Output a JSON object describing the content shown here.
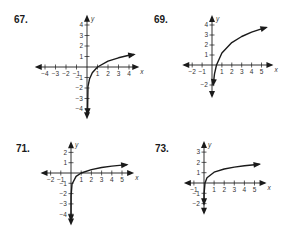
{
  "chart_data": [
    {
      "type": "line",
      "problem": "67.",
      "title": "",
      "xlabel": "x",
      "ylabel": "y",
      "x_ticks": [
        -4,
        -3,
        -2,
        -1,
        1,
        2,
        3,
        4
      ],
      "y_ticks": [
        -4,
        -3,
        -2,
        -1,
        1,
        2,
        3,
        4
      ],
      "xlim": [
        -4.5,
        4.5
      ],
      "ylim": [
        -4.5,
        4.5
      ],
      "grid": false,
      "series": [
        {
          "name": "curve",
          "points": [
            [
              0.05,
              -4.5
            ],
            [
              0.1,
              -1.84
            ],
            [
              0.25,
              -1.11
            ],
            [
              0.5,
              -0.55
            ],
            [
              1,
              0
            ],
            [
              2,
              0.55
            ],
            [
              3,
              0.88
            ],
            [
              4,
              1.11
            ],
            [
              4.5,
              1.2
            ]
          ]
        }
      ]
    },
    {
      "type": "line",
      "problem": "69.",
      "xlabel": "x",
      "ylabel": "y",
      "x_ticks": [
        -2,
        -1,
        1,
        2,
        3,
        4,
        5
      ],
      "y_ticks": [
        -2,
        1,
        2,
        3,
        4
      ],
      "xlim": [
        -2.5,
        5.7
      ],
      "ylim": [
        -2.8,
        4.5
      ],
      "grid": false,
      "series": [
        {
          "name": "curve",
          "points": [
            [
              0.12,
              -2
            ],
            [
              0.25,
              -0.88
            ],
            [
              0.45,
              0
            ],
            [
              1,
              1.2
            ],
            [
              2,
              2.24
            ],
            [
              3,
              2.85
            ],
            [
              4,
              3.28
            ],
            [
              5,
              3.61
            ],
            [
              5.5,
              3.76
            ]
          ]
        }
      ]
    },
    {
      "type": "line",
      "problem": "71.",
      "xlabel": "x",
      "ylabel": "y",
      "x_ticks": [
        -2,
        -1,
        1,
        2,
        3,
        4,
        5
      ],
      "y_ticks": [
        -4,
        -3,
        -2,
        -1,
        1,
        2
      ],
      "xlim": [
        -2.5,
        5.7
      ],
      "ylim": [
        -4.6,
        2.6
      ],
      "grid": false,
      "series": [
        {
          "name": "curve",
          "points": [
            [
              0.0003,
              -4.6
            ],
            [
              0.01,
              -2.2
            ],
            [
              0.1,
              -1.1
            ],
            [
              0.5,
              -0.33
            ],
            [
              1,
              0
            ],
            [
              2,
              0.33
            ],
            [
              3,
              0.53
            ],
            [
              4,
              0.67
            ],
            [
              5,
              0.77
            ],
            [
              5.5,
              0.82
            ]
          ]
        }
      ]
    },
    {
      "type": "line",
      "problem": "73.",
      "xlabel": "x",
      "ylabel": "y",
      "x_ticks": [
        -1,
        1,
        2,
        3,
        4,
        5
      ],
      "y_ticks": [
        -2,
        -1,
        1,
        2,
        3
      ],
      "xlim": [
        -1.5,
        5.7
      ],
      "ylim": [
        -2.6,
        3.6
      ],
      "grid": false,
      "series": [
        {
          "name": "curve",
          "points": [
            [
              0.001,
              -2.06
            ],
            [
              0.01,
              -1.02
            ],
            [
              0.1,
              0.01
            ],
            [
              0.3,
              0.51
            ],
            [
              1,
              1.05
            ],
            [
              2,
              1.36
            ],
            [
              3,
              1.54
            ],
            [
              4,
              1.67
            ],
            [
              5,
              1.77
            ],
            [
              5.5,
              1.82
            ]
          ]
        }
      ]
    }
  ],
  "labels": {
    "p67": "67.",
    "p69": "69.",
    "p71": "71.",
    "p73": "73."
  }
}
